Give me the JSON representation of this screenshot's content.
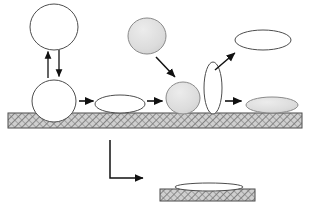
{
  "figure": {
    "type": "schematic-diagram",
    "width": 310,
    "height": 210,
    "background": "#ffffff"
  },
  "palette": {
    "outline": "#4d4d4d",
    "outline_dark": "#333333",
    "arrow": "#111111",
    "fill_white": "#ffffff",
    "fill_gray": "#d9d9d9",
    "substrate_fill": "#c9c9c9",
    "substrate_hatch": "#6e6e6e",
    "substrate_border": "#4a4a4a"
  },
  "substrates": [
    {
      "name": "main-substrate",
      "x": 8,
      "y": 113,
      "width": 294,
      "height": 15,
      "label": "hatched substrate bar"
    },
    {
      "name": "lower-substrate",
      "x": 160,
      "y": 189,
      "width": 95,
      "height": 12,
      "label": "hatched substrate bar lower"
    }
  ],
  "shapes": [
    {
      "name": "airborne-circle-top-left",
      "kind": "circle",
      "cx": 54,
      "cy": 27,
      "rx": 24,
      "ry": 23,
      "fill": "white"
    },
    {
      "name": "sessile-circle-left",
      "kind": "circle",
      "cx": 54,
      "cy": 101,
      "rx": 22,
      "ry": 21,
      "fill": "white"
    },
    {
      "name": "flat-ellipse-white-left",
      "kind": "ellipse",
      "cx": 120,
      "cy": 104,
      "rx": 25,
      "ry": 9,
      "fill": "white"
    },
    {
      "name": "airborne-circle-gray-top",
      "kind": "circle",
      "cx": 147,
      "cy": 36,
      "rx": 19,
      "ry": 18,
      "fill": "gray"
    },
    {
      "name": "sessile-circle-gray-center",
      "kind": "circle",
      "cx": 183,
      "cy": 98,
      "rx": 17,
      "ry": 16,
      "fill": "gray"
    },
    {
      "name": "vertical-ellipse-white",
      "kind": "ellipse",
      "cx": 213,
      "cy": 88,
      "rx": 9,
      "ry": 26,
      "fill": "white"
    },
    {
      "name": "airborne-ellipse-top-right",
      "kind": "ellipse",
      "cx": 263,
      "cy": 40,
      "rx": 28,
      "ry": 10,
      "fill": "white"
    },
    {
      "name": "sessile-ellipse-gray-right",
      "kind": "ellipse",
      "cx": 272,
      "cy": 105,
      "rx": 26,
      "ry": 8,
      "fill": "gray"
    },
    {
      "name": "thin-film-ellipse-lower",
      "kind": "ellipse",
      "cx": 209,
      "cy": 187,
      "rx": 34,
      "ry": 4,
      "fill": "white"
    }
  ],
  "arrows": [
    {
      "name": "arrow-up-left-vertical",
      "kind": "straight",
      "x1": 48,
      "y1": 78,
      "x2": 48,
      "y2": 50,
      "head": "end"
    },
    {
      "name": "arrow-down-left-vertical",
      "kind": "straight",
      "x1": 59,
      "y1": 50,
      "x2": 59,
      "y2": 78,
      "head": "end"
    },
    {
      "name": "arrow-right-circle-to-ellipse",
      "kind": "straight",
      "x1": 79,
      "y1": 101,
      "x2": 95,
      "y2": 101,
      "head": "end"
    },
    {
      "name": "arrow-right-ellipse-to-graycircle",
      "kind": "straight",
      "x1": 147,
      "y1": 101,
      "x2": 164,
      "y2": 101,
      "head": "end"
    },
    {
      "name": "arrow-right-to-gray-ellipse",
      "kind": "straight",
      "x1": 225,
      "y1": 101,
      "x2": 243,
      "y2": 101,
      "head": "end"
    },
    {
      "name": "arrow-diagonal-down-right",
      "kind": "straight",
      "x1": 156,
      "y1": 57,
      "x2": 176,
      "y2": 78,
      "head": "end"
    },
    {
      "name": "arrow-diagonal-up-right",
      "kind": "straight",
      "x1": 215,
      "y1": 70,
      "x2": 236,
      "y2": 52,
      "head": "end"
    },
    {
      "name": "arrow-elbow-down-right",
      "kind": "elbow",
      "x1": 110,
      "y1": 140,
      "x2": 110,
      "y2": 178,
      "x3": 146,
      "y3": 178,
      "head": "end"
    }
  ],
  "chart_data": {
    "type": "diagram",
    "stages": [
      {
        "step": 1,
        "label": "free spherical droplet (airborne)",
        "state": "sphere",
        "fill": "white"
      },
      {
        "step": 2,
        "label": "droplet resting on substrate",
        "state": "sphere",
        "fill": "white"
      },
      {
        "step": 3,
        "label": "spread flattened droplet",
        "state": "oblate",
        "fill": "white"
      },
      {
        "step": 4,
        "label": "impacting particle",
        "state": "sphere",
        "fill": "gray"
      },
      {
        "step": 5,
        "label": "compressed droplet on substrate",
        "state": "sphere",
        "fill": "gray"
      },
      {
        "step": 6,
        "label": "recoil elongated column",
        "state": "prolate",
        "fill": "white"
      },
      {
        "step": 7,
        "label": "ejected lamella (rebound)",
        "state": "oblate",
        "fill": "white"
      },
      {
        "step": 8,
        "label": "final deposited film",
        "state": "oblate",
        "fill": "gray"
      },
      {
        "step": 9,
        "label": "thin spread film on lower substrate",
        "state": "thin-film",
        "fill": "white"
      }
    ]
  }
}
